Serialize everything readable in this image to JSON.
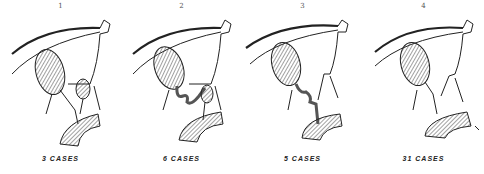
{
  "figure": {
    "panels": [
      {
        "number": "1",
        "caption": "3 CASES",
        "variant": "short-duct"
      },
      {
        "number": "2",
        "caption": "6 CASES",
        "variant": "tortuous-duct"
      },
      {
        "number": "3",
        "caption": "5 CASES",
        "variant": "long-tortuous-duct"
      },
      {
        "number": "4",
        "caption": "31 CASES",
        "variant": "normal"
      }
    ],
    "colors": {
      "ink": "#222222",
      "shade": "#9a9a9a",
      "background": "#ffffff"
    }
  }
}
